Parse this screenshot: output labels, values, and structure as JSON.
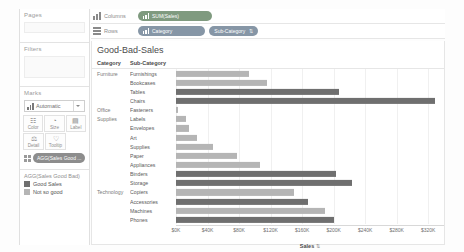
{
  "left_panel": {
    "pages_label": "Pages",
    "filters_label": "Filters",
    "marks_label": "Marks",
    "mark_type": "Automatic",
    "mark_buttons": [
      {
        "label": "Color",
        "icon": "color-palette-icon",
        "glyph": "☷"
      },
      {
        "label": "Size",
        "icon": "size-icon",
        "glyph": "◔"
      },
      {
        "label": "Label",
        "icon": "label-icon",
        "glyph": "▤"
      },
      {
        "label": "Detail",
        "icon": "detail-icon",
        "glyph": "⚖"
      },
      {
        "label": "Tooltip",
        "icon": "tooltip-icon",
        "glyph": "♡"
      }
    ],
    "marks_pill": "AGG(Sales Good ...",
    "legend": {
      "title": "AGG(Sales Good Bad)",
      "items": [
        {
          "label": "Good Sales",
          "color": "#6f6f6f"
        },
        {
          "label": "Not so good",
          "color": "#b5b5b5"
        }
      ]
    }
  },
  "shelves": {
    "columns": {
      "name": "Columns",
      "pills": [
        {
          "text": "SUM(Sales)",
          "color_class": "green",
          "sort": ""
        }
      ]
    },
    "rows": {
      "name": "Rows",
      "pills": [
        {
          "text": "Category",
          "color_class": "blue",
          "sort": ""
        },
        {
          "text": "Sub-Category",
          "color_class": "blue",
          "sort": "⇅"
        }
      ]
    }
  },
  "view": {
    "title": "Good-Bad-Sales",
    "col_header_category": "Category",
    "col_header_subcategory": "Sub-Category"
  },
  "chart_data": {
    "type": "bar",
    "title": "Good-Bad-Sales",
    "xlabel": "Sales",
    "ylabel": "",
    "xlim": [
      0,
      340000
    ],
    "grid": true,
    "orientation": "horizontal",
    "legend_position": "left",
    "tick_values": [
      0,
      40000,
      80000,
      120000,
      160000,
      200000,
      240000,
      280000,
      320000
    ],
    "tick_labels": [
      "$0K",
      "$40K",
      "$80K",
      "$120K",
      "$160K",
      "$200K",
      "$240K",
      "$280K",
      "$320K"
    ],
    "color_map": {
      "Good Sales": "#6f6f6f",
      "Not so good": "#b5b5b5"
    },
    "rows": [
      {
        "category": "Furniture",
        "show_category": true,
        "subcategory": "Furnishings",
        "value": 92000,
        "series": "Not so good"
      },
      {
        "category": "Furniture",
        "show_category": false,
        "subcategory": "Bookcases",
        "value": 115000,
        "series": "Not so good"
      },
      {
        "category": "Furniture",
        "show_category": false,
        "subcategory": "Tables",
        "value": 207000,
        "series": "Good Sales"
      },
      {
        "category": "Furniture",
        "show_category": false,
        "subcategory": "Chairs",
        "value": 328000,
        "series": "Good Sales"
      },
      {
        "category": "Office Supplies",
        "show_category": true,
        "subcategory": "Fasteners",
        "value": 3000,
        "series": "Not so good"
      },
      {
        "category": "Office Supplies",
        "show_category": false,
        "subcategory": "Labels",
        "value": 12500,
        "series": "Not so good"
      },
      {
        "category": "Office Supplies",
        "show_category": false,
        "subcategory": "Envelopes",
        "value": 16500,
        "series": "Not so good"
      },
      {
        "category": "Office Supplies",
        "show_category": false,
        "subcategory": "Art",
        "value": 27000,
        "series": "Not so good"
      },
      {
        "category": "Office Supplies",
        "show_category": false,
        "subcategory": "Supplies",
        "value": 46500,
        "series": "Not so good"
      },
      {
        "category": "Office Supplies",
        "show_category": false,
        "subcategory": "Paper",
        "value": 78000,
        "series": "Not so good"
      },
      {
        "category": "Office Supplies",
        "show_category": false,
        "subcategory": "Appliances",
        "value": 107000,
        "series": "Not so good"
      },
      {
        "category": "Office Supplies",
        "show_category": false,
        "subcategory": "Binders",
        "value": 203000,
        "series": "Good Sales"
      },
      {
        "category": "Office Supplies",
        "show_category": false,
        "subcategory": "Storage",
        "value": 223000,
        "series": "Good Sales"
      },
      {
        "category": "Technology",
        "show_category": true,
        "subcategory": "Copiers",
        "value": 150000,
        "series": "Not so good"
      },
      {
        "category": "Technology",
        "show_category": false,
        "subcategory": "Accessories",
        "value": 167000,
        "series": "Good Sales"
      },
      {
        "category": "Technology",
        "show_category": false,
        "subcategory": "Machines",
        "value": 189000,
        "series": "Not so good"
      },
      {
        "category": "Technology",
        "show_category": false,
        "subcategory": "Phones",
        "value": 200000,
        "series": "Good Sales"
      }
    ]
  }
}
